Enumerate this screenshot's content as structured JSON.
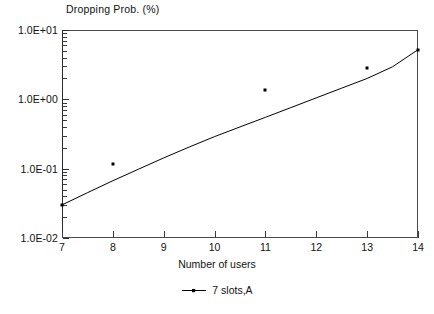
{
  "chart_data": {
    "type": "line",
    "title": "Dropping Prob. (%)",
    "xlabel": "Number of users",
    "ylabel": "",
    "yscale": "log",
    "xscale": "linear",
    "xlim": [
      7,
      14
    ],
    "ylim": [
      0.01,
      10
    ],
    "grid": false,
    "legend_position": "bottom",
    "x_ticklabels": [
      "7",
      "8",
      "9",
      "10",
      "11",
      "12",
      "13",
      "14"
    ],
    "x_tickvalues": [
      7,
      8,
      9,
      10,
      11,
      12,
      13,
      14
    ],
    "y_ticklabels": [
      "1.0E+01",
      "1.0E+00",
      "1.0E-01",
      "1.0E-02"
    ],
    "y_tickvalues": [
      10,
      1,
      0.1,
      0.01
    ],
    "series": [
      {
        "name": "7 slots,A",
        "marker": "square",
        "color": "#000000",
        "x": [
          7,
          8,
          11,
          13,
          14
        ],
        "values": [
          0.03,
          0.115,
          1.35,
          2.8,
          5.2
        ],
        "curve_x": [
          7,
          7.5,
          8,
          8.5,
          9,
          9.5,
          10,
          10.5,
          11,
          11.5,
          12,
          12.5,
          13,
          13.5,
          14
        ],
        "curve_y": [
          0.03,
          0.045,
          0.067,
          0.098,
          0.143,
          0.205,
          0.29,
          0.4,
          0.55,
          0.76,
          1.05,
          1.45,
          2.0,
          2.95,
          5.2
        ]
      }
    ],
    "legend": [
      {
        "label": "7 slots,A",
        "symbol": "line-with-marker",
        "color": "#000000"
      }
    ]
  },
  "axis": {
    "minor_decades_per_tick": [
      2,
      3,
      4,
      5,
      6,
      7,
      8,
      9
    ]
  }
}
